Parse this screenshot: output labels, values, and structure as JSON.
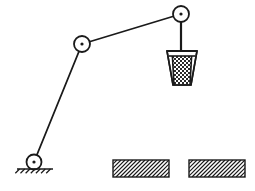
{
  "figure": {
    "background_color": "#ffffff",
    "stroke_color": "#1a1a1a",
    "fill_color": "#ffffff",
    "width": 255,
    "height": 191
  },
  "joints": [
    {
      "id": "ground-pivot",
      "name": "Ground pivot joint",
      "cx": 34,
      "cy": 162,
      "r": 7.5,
      "center_dot_r": 1.6
    },
    {
      "id": "middle-joint",
      "name": "Middle revolute joint",
      "cx": 82,
      "cy": 44,
      "r": 8,
      "center_dot_r": 1.6
    },
    {
      "id": "top-joint",
      "name": "Top right revolute joint",
      "cx": 181,
      "cy": 14,
      "r": 8,
      "center_dot_r": 1.6
    }
  ],
  "links": [
    {
      "id": "lower-link",
      "name": "Lower link",
      "x1": 34,
      "y1": 162,
      "x2": 82,
      "y2": 44,
      "stroke_width": 1.8
    },
    {
      "id": "upper-link",
      "name": "Upper link",
      "x1": 82,
      "y1": 44,
      "x2": 181,
      "y2": 14,
      "stroke_width": 1.8
    }
  ],
  "rope": {
    "id": "suspension-rope",
    "name": "Suspension rope",
    "x1": 181,
    "y1": 14,
    "x2": 181,
    "y2": 52,
    "stroke_width": 2.2
  },
  "bucket": {
    "id": "bucket",
    "name": "Suspended bucket",
    "rim_y": 51,
    "rim_left_x": 167,
    "rim_right_x": 197,
    "bottom_y": 85,
    "bottom_left_x": 173,
    "bottom_right_x": 191,
    "rim_bar_y": 53,
    "fill_pattern": "checkerboard",
    "fill_top_y": 56,
    "stroke_width": 1.6
  },
  "ground_support": {
    "id": "ground-support",
    "name": "Fixed ground support hatching",
    "line_y": 169,
    "line_x1": 17,
    "line_x2": 53,
    "hatch_count": 7,
    "hatch_length": 6,
    "hatch_angle_deg": 45
  },
  "ground_blocks": [
    {
      "id": "ground-block-left",
      "name": "Left hatched ground block",
      "x": 113,
      "y": 160,
      "width": 56,
      "height": 17,
      "hatch_angle_deg": 45,
      "hatch_spacing": 4
    },
    {
      "id": "ground-block-right",
      "name": "Right hatched ground block",
      "x": 189,
      "y": 160,
      "width": 56,
      "height": 17,
      "hatch_angle_deg": 45,
      "hatch_spacing": 4
    }
  ]
}
